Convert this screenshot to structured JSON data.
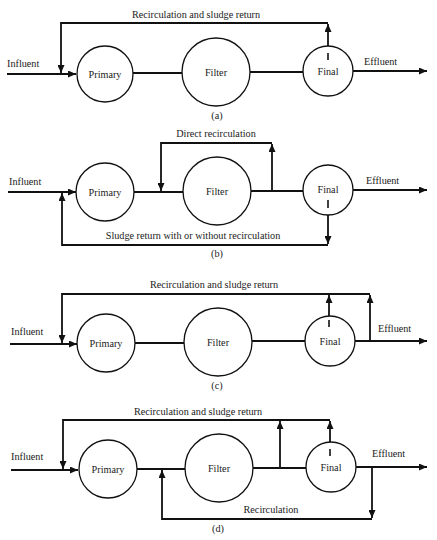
{
  "figure": {
    "colors": {
      "line": "#111111",
      "background": "#ffffff"
    },
    "diagrams": [
      {
        "caption": "(a)",
        "influent_label": "Influent",
        "effluent_label": "Effluent",
        "units": {
          "primary": "Primary",
          "filter": "Filter",
          "final": "Final"
        },
        "top_flow_label": "Recirculation and sludge return"
      },
      {
        "caption": "(b)",
        "influent_label": "Influent",
        "effluent_label": "Effluent",
        "units": {
          "primary": "Primary",
          "filter": "Filter",
          "final": "Final"
        },
        "top_flow_label": "Direct recirculation",
        "bottom_flow_label": "Sludge return with or without recirculation"
      },
      {
        "caption": "(c)",
        "influent_label": "Influent",
        "effluent_label": "Effluent",
        "units": {
          "primary": "Primary",
          "filter": "Filter",
          "final": "Final"
        },
        "top_flow_label": "Recirculation and sludge return"
      },
      {
        "caption": "(d)",
        "influent_label": "Influent",
        "effluent_label": "Effluent",
        "units": {
          "primary": "Primary",
          "filter": "Filter",
          "final": "Final"
        },
        "top_flow_label": "Recirculation and sludge return",
        "bottom_flow_label": "Recirculation"
      }
    ]
  }
}
